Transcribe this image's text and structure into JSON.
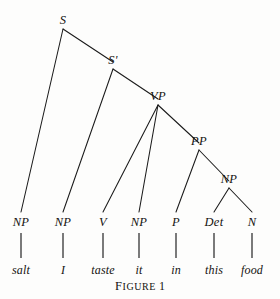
{
  "figure": {
    "caption_word": "Figure",
    "caption_number": "1",
    "background_color": "#fdfdfc",
    "ink_color": "#14120f",
    "line_color": "#1a1a1a"
  },
  "tree": {
    "sentence": "salt I taste it in this food",
    "nodes": [
      {
        "id": "S",
        "label": "S",
        "x": 63,
        "y": 29,
        "label_x": 63,
        "label_y": 26
      },
      {
        "id": "Sbar",
        "label": "S'",
        "x": 113,
        "y": 69,
        "label_x": 113,
        "label_y": 66
      },
      {
        "id": "VP",
        "label": "VP",
        "x": 158,
        "y": 105,
        "label_x": 158,
        "label_y": 102
      },
      {
        "id": "PP",
        "label": "PP",
        "x": 199,
        "y": 150,
        "label_x": 199,
        "label_y": 147
      },
      {
        "id": "NPdet",
        "label": "NP",
        "x": 229,
        "y": 188,
        "label_x": 229,
        "label_y": 185
      },
      {
        "id": "NP1",
        "label": "NP",
        "x": 21,
        "y": 212,
        "label_x": 21,
        "label_y": 228
      },
      {
        "id": "NP2",
        "label": "NP",
        "x": 63,
        "y": 212,
        "label_x": 63,
        "label_y": 228
      },
      {
        "id": "V",
        "label": "V",
        "x": 103,
        "y": 212,
        "label_x": 103,
        "label_y": 228
      },
      {
        "id": "NP3",
        "label": "NP",
        "x": 139,
        "y": 212,
        "label_x": 139,
        "label_y": 228
      },
      {
        "id": "P",
        "label": "P",
        "x": 176,
        "y": 212,
        "label_x": 176,
        "label_y": 228
      },
      {
        "id": "Det",
        "label": "Det",
        "x": 214,
        "y": 212,
        "label_x": 214,
        "label_y": 228
      },
      {
        "id": "N",
        "label": "N",
        "x": 252,
        "y": 212,
        "label_x": 252,
        "label_y": 228
      }
    ],
    "edges": [
      {
        "from": "S",
        "to": "NP1",
        "x1": 63,
        "y1": 29,
        "x2": 21,
        "y2": 212
      },
      {
        "from": "S",
        "to": "Sbar",
        "x1": 63,
        "y1": 29,
        "x2": 113,
        "y2": 62
      },
      {
        "from": "Sbar",
        "to": "NP2",
        "x1": 113,
        "y1": 69,
        "x2": 63,
        "y2": 212
      },
      {
        "from": "Sbar",
        "to": "VP",
        "x1": 113,
        "y1": 69,
        "x2": 158,
        "y2": 99
      },
      {
        "from": "VP",
        "to": "V",
        "x1": 158,
        "y1": 105,
        "x2": 103,
        "y2": 212
      },
      {
        "from": "VP",
        "to": "NP3",
        "x1": 158,
        "y1": 105,
        "x2": 139,
        "y2": 212
      },
      {
        "from": "VP",
        "to": "PP",
        "x1": 158,
        "y1": 105,
        "x2": 199,
        "y2": 143
      },
      {
        "from": "PP",
        "to": "P",
        "x1": 199,
        "y1": 150,
        "x2": 176,
        "y2": 212
      },
      {
        "from": "PP",
        "to": "NPdet",
        "x1": 199,
        "y1": 150,
        "x2": 229,
        "y2": 181
      },
      {
        "from": "NPdet",
        "to": "Det",
        "x1": 229,
        "y1": 188,
        "x2": 214,
        "y2": 212
      },
      {
        "from": "NPdet",
        "to": "N",
        "x1": 229,
        "y1": 188,
        "x2": 252,
        "y2": 212
      }
    ],
    "stems": [
      {
        "from": "NP1",
        "to": "salt",
        "x": 21,
        "y1": 233,
        "y2": 258
      },
      {
        "from": "NP2",
        "to": "I",
        "x": 63,
        "y1": 233,
        "y2": 258
      },
      {
        "from": "V",
        "to": "taste",
        "x": 103,
        "y1": 233,
        "y2": 258
      },
      {
        "from": "NP3",
        "to": "it",
        "x": 139,
        "y1": 233,
        "y2": 258
      },
      {
        "from": "P",
        "to": "in",
        "x": 176,
        "y1": 233,
        "y2": 258
      },
      {
        "from": "Det",
        "to": "this",
        "x": 214,
        "y1": 233,
        "y2": 258
      },
      {
        "from": "N",
        "to": "food",
        "x": 252,
        "y1": 233,
        "y2": 258
      }
    ],
    "terminals": [
      {
        "id": "salt",
        "text": "salt",
        "x": 21,
        "y": 264
      },
      {
        "id": "I",
        "text": "I",
        "x": 63,
        "y": 264
      },
      {
        "id": "taste",
        "text": "taste",
        "x": 103,
        "y": 264
      },
      {
        "id": "it",
        "text": "it",
        "x": 139,
        "y": 264
      },
      {
        "id": "in",
        "text": "in",
        "x": 176,
        "y": 264
      },
      {
        "id": "this",
        "text": "this",
        "x": 214,
        "y": 264
      },
      {
        "id": "food",
        "text": "food",
        "x": 252,
        "y": 264
      }
    ]
  }
}
